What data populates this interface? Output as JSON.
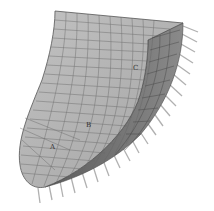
{
  "figure": {
    "labels": [
      {
        "id": "A",
        "text": "A",
        "x": 50,
        "y": 146
      },
      {
        "id": "B",
        "text": "B",
        "x": 86,
        "y": 124
      },
      {
        "id": "C",
        "text": "C",
        "x": 133,
        "y": 67
      }
    ],
    "colors": {
      "surface": "#b4b4b4",
      "inner_surface": "#7a7a7a",
      "mesh_lines": "#5a5a5a",
      "arrows": "#9a9a9a",
      "background": "#ffffff"
    }
  }
}
